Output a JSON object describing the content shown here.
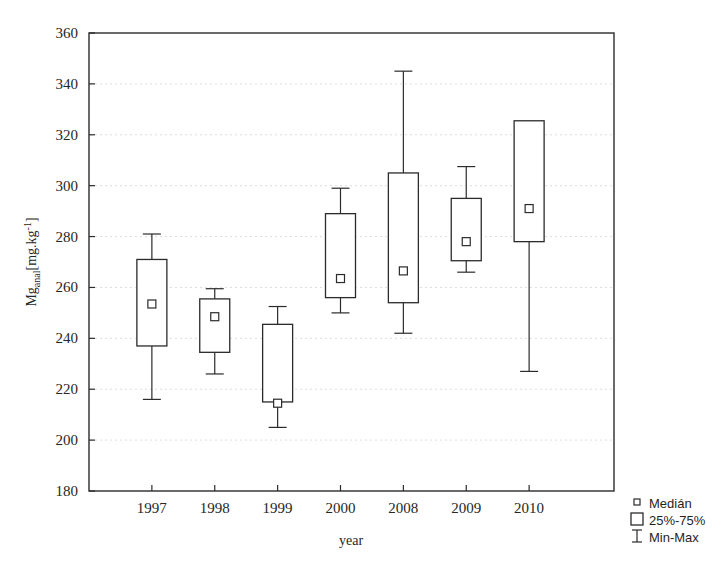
{
  "chart_data": {
    "type": "box",
    "title": "",
    "xlabel": "year",
    "ylabel": "Mg_anal [mg.kg-1]",
    "ylabel_main": "Mg",
    "ylabel_sub": "anal",
    "ylabel_unit": "[mg.kg",
    "ylabel_exp": "-1",
    "ylabel_close": "]",
    "categories": [
      "1997",
      "1998",
      "1999",
      "2000",
      "2008",
      "2009",
      "2010"
    ],
    "ylim": [
      180,
      360
    ],
    "yticks": [
      180,
      200,
      220,
      240,
      260,
      280,
      300,
      320,
      340,
      360
    ],
    "ytick_labels": [
      "180",
      "200",
      "220",
      "240",
      "260",
      "280",
      "300",
      "320",
      "340",
      "360"
    ],
    "grid": true,
    "grid_axis": "y",
    "series": [
      {
        "name": "Medián",
        "values": [
          253.5,
          248.5,
          214.5,
          263.5,
          266.5,
          278.0,
          291.0
        ]
      },
      {
        "name": "Q1 (25%)",
        "values": [
          237.0,
          234.5,
          215.0,
          256.0,
          254.0,
          270.5,
          278.0
        ]
      },
      {
        "name": "Q3 (75%)",
        "values": [
          271.0,
          255.5,
          245.5,
          289.0,
          305.0,
          295.0,
          325.5
        ]
      },
      {
        "name": "Min",
        "values": [
          216.0,
          226.0,
          205.0,
          250.0,
          242.0,
          266.0,
          227.0
        ]
      },
      {
        "name": "Max",
        "values": [
          281.0,
          259.5,
          252.5,
          299.0,
          345.0,
          307.5,
          325.5
        ]
      }
    ],
    "boxes": [
      {
        "category": "1997",
        "min": 216.0,
        "q1": 237.0,
        "median": 253.5,
        "q3": 271.0,
        "max": 281.0
      },
      {
        "category": "1998",
        "min": 226.0,
        "q1": 234.5,
        "median": 248.5,
        "q3": 255.5,
        "max": 259.5
      },
      {
        "category": "1999",
        "min": 205.0,
        "q1": 215.0,
        "median": 214.5,
        "q3": 245.5,
        "max": 252.5
      },
      {
        "category": "2000",
        "min": 250.0,
        "q1": 256.0,
        "median": 263.5,
        "q3": 289.0,
        "max": 299.0
      },
      {
        "category": "2008",
        "min": 242.0,
        "q1": 254.0,
        "median": 266.5,
        "q3": 305.0,
        "max": 345.0
      },
      {
        "category": "2009",
        "min": 266.0,
        "q1": 270.5,
        "median": 278.0,
        "q3": 295.0,
        "max": 307.5
      },
      {
        "category": "2010",
        "min": 227.0,
        "q1": 278.0,
        "median": 291.0,
        "q3": 325.5,
        "max": 325.5
      }
    ],
    "legend": {
      "position": "bottom-right",
      "entries": [
        {
          "label": "Medián",
          "symbol": "small-square"
        },
        {
          "label": "25%-75%",
          "symbol": "box"
        },
        {
          "label": "Min-Max",
          "symbol": "whisker"
        }
      ]
    },
    "colors": {
      "line": "#2b2b2b",
      "grid": "#d9d3cf",
      "background": "#ffffff"
    }
  }
}
